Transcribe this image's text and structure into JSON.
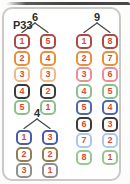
{
  "card": {
    "id": "P33"
  },
  "colors": {
    "digit": "#dc4b2f",
    "label": "#2d2d2d",
    "card_border": "#c9c9c7",
    "branch_line": "#4a4a4a"
  },
  "groups": [
    {
      "label": "6",
      "rows": [
        {
          "left": "1",
          "right": "5",
          "border": "#ac4a43"
        },
        {
          "left": "2",
          "right": "4",
          "border": "#e6913c"
        },
        {
          "left": "3",
          "right": "3",
          "border": "#efb98a"
        },
        {
          "left": "4",
          "right": "2",
          "border": "#3b3b3b"
        },
        {
          "left": "5",
          "right": "1",
          "border": "#8dc08d"
        }
      ]
    },
    {
      "label": "9",
      "rows": [
        {
          "left": "1",
          "right": "8",
          "border": "#ac4a43"
        },
        {
          "left": "2",
          "right": "7",
          "border": "#e6913c"
        },
        {
          "left": "3",
          "right": "6",
          "border": "#ec8e95"
        },
        {
          "left": "4",
          "right": "5",
          "border": "#8dc08d"
        },
        {
          "left": "5",
          "right": "4",
          "border": "#4c67b0"
        },
        {
          "left": "6",
          "right": "3",
          "border": "#3b3b3b"
        },
        {
          "left": "7",
          "right": "2",
          "border": "#abc8ea"
        },
        {
          "left": "8",
          "right": "1",
          "border": "#97c78e"
        }
      ]
    },
    {
      "label": "4",
      "rows": [
        {
          "left": "1",
          "right": "3",
          "border": "#4d5ca6"
        },
        {
          "left": "2",
          "right": "2",
          "border": "#8f7f55"
        },
        {
          "left": "3",
          "right": "1",
          "border": "#909090"
        }
      ]
    }
  ]
}
